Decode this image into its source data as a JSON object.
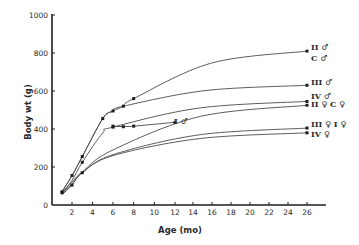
{
  "chart_data": {
    "type": "line",
    "title": "",
    "xlabel": "Age (mo)",
    "ylabel": "Body wt (g)",
    "xlim": [
      0,
      28
    ],
    "ylim": [
      0,
      1000
    ],
    "x_ticks": [
      2,
      4,
      6,
      8,
      10,
      12,
      14,
      16,
      18,
      20,
      22,
      24,
      26
    ],
    "y_ticks": [
      0,
      200,
      400,
      600,
      800,
      1000
    ],
    "grid": false,
    "legend_position": "inline labels at right end of curves",
    "series": [
      {
        "name": "II ♂",
        "label_extra": "C ♂",
        "x": [
          1,
          2,
          3,
          5,
          6,
          7,
          8,
          26
        ],
        "values": [
          70,
          155,
          255,
          455,
          495,
          520,
          560,
          810
        ],
        "markers": [
          1,
          2,
          3,
          5,
          6,
          7,
          8,
          26
        ]
      },
      {
        "name": "III ♂",
        "x": [
          1,
          2,
          3,
          5,
          6,
          7,
          26
        ],
        "values": [
          70,
          155,
          255,
          455,
          495,
          520,
          630
        ],
        "markers": [
          26
        ]
      },
      {
        "name": "IV ♂",
        "x": [
          1,
          2,
          3,
          5,
          6,
          26
        ],
        "values": [
          65,
          130,
          225,
          380,
          410,
          545
        ],
        "markers": [
          1,
          3,
          6,
          26
        ]
      },
      {
        "name": "I ♂",
        "x": [
          6,
          7,
          8,
          12
        ],
        "values": [
          415,
          412,
          415,
          435
        ],
        "markers": [
          6,
          7,
          8,
          12
        ]
      },
      {
        "name": "II ♀",
        "label_extra": "C ♀",
        "x": [
          1,
          2,
          3,
          6,
          26
        ],
        "values": [
          60,
          120,
          175,
          290,
          525
        ],
        "markers": [
          26
        ]
      },
      {
        "name": "III ♀",
        "label_extra": "I ♀",
        "x": [
          1,
          2,
          3,
          6,
          26
        ],
        "values": [
          55,
          105,
          170,
          265,
          405
        ],
        "markers": [
          2,
          3,
          26
        ]
      },
      {
        "name": "IV ♀",
        "x": [
          1,
          2,
          3,
          6,
          26
        ],
        "values": [
          55,
          110,
          170,
          260,
          380
        ],
        "markers": [
          26
        ]
      }
    ]
  },
  "labels": {
    "y_axis_title": "Body wt (g)",
    "x_axis_title": "Age (mo)",
    "origin": "0",
    "series_labels": [
      {
        "text": "II ♂",
        "x": 311,
        "y": 50
      },
      {
        "text": "C ♂",
        "x": 311,
        "y": 61
      },
      {
        "text": "III ♂",
        "x": 311,
        "y": 85
      },
      {
        "text": "IV ♂",
        "x": 311,
        "y": 99
      },
      {
        "text": "II ♀  C ♀",
        "x": 311,
        "y": 107
      },
      {
        "text": "I ♂",
        "x": 174,
        "y": 124
      },
      {
        "text": "III ♀   I ♀",
        "x": 311,
        "y": 127
      },
      {
        "text": "IV ♀",
        "x": 311,
        "y": 137
      }
    ]
  },
  "colors": {
    "line": "#4a4a4a",
    "axis": "#1e1e1e",
    "text": "#2a2a2a",
    "background": "#ffffff"
  }
}
